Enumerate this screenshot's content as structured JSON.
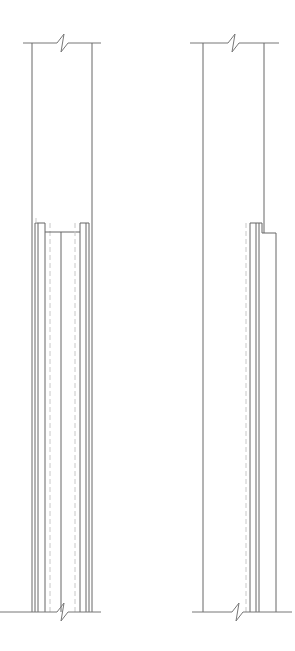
{
  "drawing": {
    "type": "architectural section detail",
    "views": [
      {
        "name": "left-detail",
        "description": "Column with cladding on both faces, break lines top and bottom"
      },
      {
        "name": "right-detail",
        "description": "Column with cladding on one face, break lines top and bottom"
      }
    ],
    "colors": {
      "line": "#777777",
      "hidden_line": "#c8c8c8",
      "background": "#ffffff"
    }
  }
}
